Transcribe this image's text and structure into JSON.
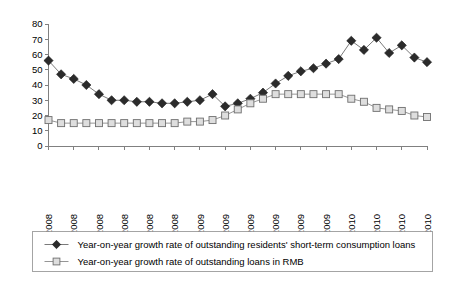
{
  "chart_data": {
    "type": "line",
    "title": "",
    "xlabel": "",
    "ylabel": "",
    "ylim": [
      0,
      80
    ],
    "ytick_step": 10,
    "grid": false,
    "legend_position": "bottom",
    "yticks": [
      "0",
      "10",
      "20",
      "30",
      "40",
      "50",
      "60",
      "70",
      "80"
    ],
    "x": [
      "Jan. 1, 2008",
      "Feb. 1, 2008",
      "Mar. 1, 2008",
      "Apr. 1, 2008",
      "May. 1, 2008",
      "Jun. 1, 2008",
      "Jul. 1, 2008",
      "Aug. 1, 2008",
      "Sep. 1, 2008",
      "Oct. 1, 2008",
      "Nov. 1, 2008",
      "Dec. 1, 2008",
      "Jan. 1, 2009",
      "Feb. 1, 2009",
      "Mar. 1, 2009",
      "Apr. 1, 2009",
      "May. 1, 2009",
      "Jun. 1, 2009",
      "Jul. 1, 2009",
      "Aug. 1, 2009",
      "Sep. 1, 2009",
      "Oct. 1, 2009",
      "Nov. 1, 2009",
      "Dec. 1, 2009",
      "Jan. 1, 2010",
      "Feb. 1, 2010",
      "Mar. 1, 2010",
      "Apr. 1, 2010",
      "May. 1, 2010",
      "Jun. 1, 2010",
      "Jul. 1, 2010"
    ],
    "xticks_shown": [
      "Jan. 1, 2008",
      "Mar. 1, 2008",
      "May. 1, 2008",
      "Jul. 1, 2008",
      "Sep. 1, 2008",
      "Nov. 1, 2008",
      "Jan. 1, 2009",
      "Mar. 1, 2009",
      "May. 1, 2009",
      "Jul. 1, 2009",
      "Sep. 1, 2009",
      "Nov. 1, 2009",
      "Jan. 1, 2010",
      "Mar. 1, 2010",
      "May. 1, 2010",
      "Jul. 1, 2010"
    ],
    "series": [
      {
        "name": "Year-on-year growth rate of outstanding residents' short-term consumption loans",
        "marker": "filled-diamond",
        "color": "#2b2b2b",
        "values": [
          56,
          47,
          44,
          40,
          34,
          30,
          30,
          29,
          29,
          28,
          28,
          29,
          30,
          34,
          26,
          28,
          31,
          35,
          41,
          46,
          49,
          51,
          54,
          57,
          69,
          63,
          71,
          61,
          66,
          58,
          55
        ]
      },
      {
        "name": "Year-on-year growth rate of outstanding loans in RMB",
        "marker": "open-square",
        "color": "#dedede",
        "values": [
          17,
          15,
          15,
          15,
          15,
          15,
          15,
          15,
          15,
          15,
          15,
          16,
          16,
          17,
          20,
          24,
          28,
          31,
          34,
          34,
          34,
          34,
          34,
          34,
          31,
          29,
          25,
          24,
          23,
          20,
          19
        ]
      }
    ]
  },
  "legend": {
    "items": [
      {
        "label": "Year-on-year growth rate of outstanding residents' short-term consumption loans",
        "marker": "filled-diamond"
      },
      {
        "label": "Year-on-year growth rate of outstanding loans in RMB",
        "marker": "open-square"
      }
    ]
  }
}
